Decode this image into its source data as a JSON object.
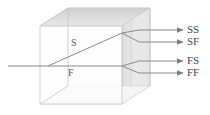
{
  "figure": {
    "colors": {
      "background": "#ffffff",
      "ray": "#8a8a8a",
      "ray_dark": "#6e6e6e",
      "label": "#454545",
      "cube_face_front": "#fbfbfb",
      "cube_face_top": "#d9d9d9",
      "cube_face_side": "#e6e6e6",
      "cube_edge": "#c9c9c9",
      "slab_fill": "#e2e2e2"
    }
  },
  "cube": {
    "name": "transparent-crystal-block",
    "front_face": {
      "x": 40,
      "y": 26,
      "width": 82,
      "height": 78
    },
    "depth_offset": {
      "dx": 28,
      "dy": -18
    },
    "slab": {
      "x": 122,
      "y": 8,
      "width": 16,
      "height": 78
    }
  },
  "rays": {
    "incident": {
      "label": "",
      "start": {
        "x": 8,
        "y": 66
      },
      "split": {
        "x": 48,
        "y": 66
      }
    },
    "internal": [
      {
        "id": "S",
        "label": "S",
        "label_pos": {
          "x": 73,
          "y": 43
        },
        "from": {
          "x": 48,
          "y": 66
        },
        "to": {
          "x": 122,
          "y": 33
        }
      },
      {
        "id": "F",
        "label": "F",
        "label_pos": {
          "x": 70,
          "y": 72
        },
        "from": {
          "x": 48,
          "y": 66
        },
        "to": {
          "x": 122,
          "y": 66
        }
      }
    ],
    "outputs": [
      {
        "id": "SS",
        "label": "SS",
        "split_from": "S",
        "kink": {
          "x": 139,
          "y": 30
        },
        "tip": {
          "x": 183,
          "y": 30
        },
        "label_pos": {
          "x": 188,
          "y": 25
        }
      },
      {
        "id": "SF",
        "label": "SF",
        "split_from": "S",
        "kink": {
          "x": 139,
          "y": 42
        },
        "tip": {
          "x": 183,
          "y": 42
        },
        "label_pos": {
          "x": 188,
          "y": 37
        }
      },
      {
        "id": "FS",
        "label": "FS",
        "split_from": "F",
        "kink": {
          "x": 139,
          "y": 61
        },
        "tip": {
          "x": 183,
          "y": 61
        },
        "label_pos": {
          "x": 188,
          "y": 56
        }
      },
      {
        "id": "FF",
        "label": "FF",
        "split_from": "F",
        "kink": {
          "x": 139,
          "y": 73
        },
        "tip": {
          "x": 183,
          "y": 73
        },
        "label_pos": {
          "x": 188,
          "y": 68
        }
      }
    ]
  }
}
